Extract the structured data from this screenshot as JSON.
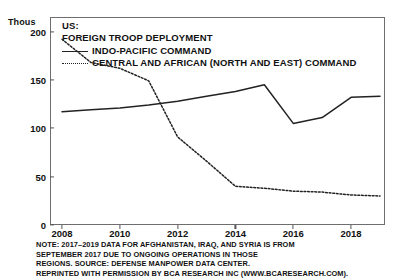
{
  "chart_data": {
    "type": "line",
    "title": "US: FOREIGN TROOP DEPLOYMENT",
    "title_lines": [
      "US:",
      "FOREIGN TROOP DEPLOYMENT"
    ],
    "unit_label": "Thous",
    "xlabel": "",
    "ylabel": "Thous",
    "xlim": [
      2008,
      2019
    ],
    "ylim": [
      0,
      215
    ],
    "grid": false,
    "legend_position": "top-left-inside",
    "x": [
      2008,
      2009,
      2010,
      2011,
      2012,
      2013,
      2014,
      2015,
      2016,
      2017,
      2018,
      2019
    ],
    "xticks": [
      2008,
      2010,
      2012,
      2014,
      2016,
      2018
    ],
    "xtick_labels": [
      "2008",
      "2010",
      "2012",
      "2014",
      "2016",
      "2018"
    ],
    "yticks": [
      0,
      50,
      100,
      150,
      200
    ],
    "ytick_labels": [
      "0",
      "50",
      "100",
      "150",
      "200"
    ],
    "series": [
      {
        "name": "INDO-PACIFIC COMMAND",
        "style": "solid",
        "color": "#222222",
        "values": [
          117,
          119,
          121,
          124,
          128,
          133,
          138,
          145,
          105,
          111,
          132,
          133
        ]
      },
      {
        "name": "CENTRAL AND AFRICAN (NORTH AND EAST) COMMAND",
        "style": "dotted",
        "color": "#222222",
        "values": [
          192,
          168,
          162,
          149,
          91,
          66,
          40,
          38,
          35,
          34,
          31,
          30
        ]
      }
    ],
    "note_lines": [
      "NOTE: 2017–2019 DATA FOR AFGHANISTAN, IRAQ, AND SYRIA IS FROM",
      "SEPTEMBER 2017 DUE TO ONGOING OPERATIONS IN THOSE",
      "REGIONS. SOURCE: DEFENSE MANPOWER DATA CENTER.",
      "REPRINTED WITH PERMISSION BY BCA RESEARCH INC (WWW.BCARESEARCH.COM)."
    ]
  }
}
